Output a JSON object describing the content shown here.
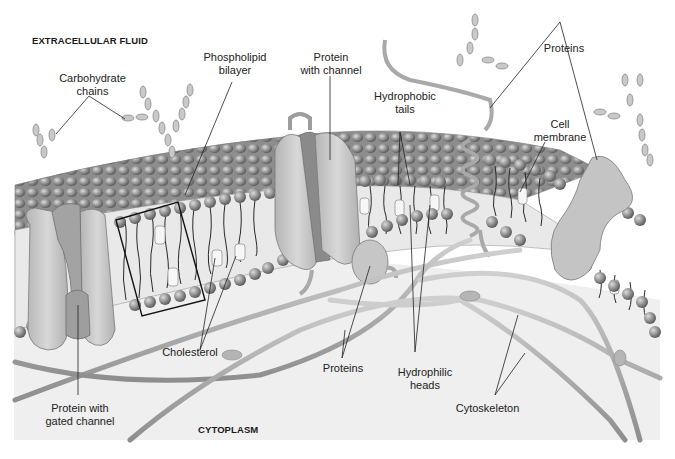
{
  "diagram": {
    "regions": {
      "top": "EXTRACELLULAR FLUID",
      "bottom": "CYTOPLASM"
    },
    "labels": {
      "carbohydrate_chains": [
        "Carbohydrate",
        "chains"
      ],
      "phospholipid_bilayer": [
        "Phospholipid",
        "bilayer"
      ],
      "protein_with_channel": [
        "Protein",
        "with channel"
      ],
      "hydrophobic_tails": [
        "Hydrophobic",
        "tails"
      ],
      "proteins_top": [
        "Proteins"
      ],
      "cell_membrane": [
        "Cell",
        "membrane"
      ],
      "cholesterol": [
        "Cholesterol"
      ],
      "proteins_bottom": [
        "Proteins"
      ],
      "hydrophilic_heads": [
        "Hydrophilic",
        "heads"
      ],
      "cytoskeleton": [
        "Cytoskeleton"
      ],
      "protein_gated_channel": [
        "Protein with",
        "gated channel"
      ]
    },
    "colors": {
      "background": "#ffffff",
      "cytoplasm": "#eeeeee",
      "membrane_surface": "#9a9a9a",
      "head": "#8c8c8c",
      "protein": "#c8c8c8",
      "protein_dark": "#8a8a8a",
      "filament": "#a9a9a9",
      "leader_line": "#222222"
    }
  }
}
